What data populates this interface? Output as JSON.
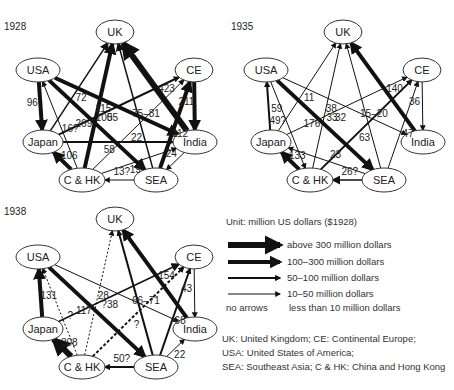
{
  "panels": [
    {
      "year": "1928",
      "ox": 0,
      "oy": 0
    },
    {
      "year": "1935",
      "ox": 228,
      "oy": 0
    },
    {
      "year": "1938",
      "ox": 0,
      "oy": 200
    }
  ],
  "nodes": [
    "UK",
    "CE",
    "USA",
    "Japan",
    "India",
    "C & HK",
    "SEA"
  ],
  "legend": {
    "unit": "Unit: million US dollars ($1928)",
    "items": [
      {
        "label": "above 300 million dollars",
        "width": 6
      },
      {
        "label": "100–300 million dollars",
        "width": 4
      },
      {
        "label": "50–100 million dollars",
        "width": 2
      },
      {
        "label": "10–50 million dollars",
        "width": 1
      }
    ],
    "no_arrows_key": "no arrows",
    "no_arrows_label": "less than 10 million dollars"
  },
  "abbrev": [
    "UK: United Kingdom; CE: Continental Europe;",
    "USA: United States of America;",
    "SEA: Southeast Asia; C & HK: China and Hong Kong"
  ],
  "chart_data": [
    {
      "year": "1928",
      "flows": [
        {
          "from": "USA",
          "to": "Japan",
          "value": "96",
          "w": 4
        },
        {
          "from": "Japan",
          "to": "UK",
          "value": "72",
          "w": 1.5
        },
        {
          "from": "C & HK",
          "to": "UK",
          "value": "100",
          "w": 4
        },
        {
          "from": "SEA",
          "to": "UK",
          "value": "75–81",
          "w": 1.5
        },
        {
          "from": "India",
          "to": "UK",
          "value": "423",
          "w": 6
        },
        {
          "from": "CE",
          "to": "India",
          "value": "211",
          "w": 4
        },
        {
          "from": "USA",
          "to": "India",
          "value": "115",
          "w": 4
        },
        {
          "from": "C & HK",
          "to": "USA",
          "value": "16?",
          "w": 1
        },
        {
          "from": "Japan",
          "to": "CE",
          "value": "55",
          "w": 2
        },
        {
          "from": "USA",
          "to": "SEA",
          "value": "269",
          "w": 4
        },
        {
          "from": "C & HK",
          "to": "CE",
          "value": "22",
          "w": 1
        },
        {
          "from": "SEA",
          "to": "CE",
          "value": "112",
          "w": 4
        },
        {
          "from": "Japan",
          "to": "India",
          "value": "58",
          "w": 2
        },
        {
          "from": "C & HK",
          "to": "Japan",
          "value": "106",
          "w": 4
        },
        {
          "from": "C & HK",
          "to": "India",
          "value": "19",
          "w": 1
        },
        {
          "from": "SEA",
          "to": "C & HK",
          "value": "13?",
          "w": 1
        },
        {
          "from": "India",
          "to": "SEA",
          "value": "24",
          "w": 1
        }
      ]
    },
    {
      "year": "1935",
      "flows": [
        {
          "from": "Japan",
          "to": "USA",
          "value": "59",
          "w": 2
        },
        {
          "from": "Japan",
          "to": "UK",
          "value": "11",
          "w": 1
        },
        {
          "from": "C & HK",
          "to": "UK",
          "value": "33",
          "w": 1
        },
        {
          "from": "SEA",
          "to": "UK",
          "value": "15–20",
          "w": 1
        },
        {
          "from": "India",
          "to": "UK",
          "value": "140",
          "w": 4
        },
        {
          "from": "CE",
          "to": "India",
          "value": "36",
          "w": 1
        },
        {
          "from": "USA",
          "to": "India",
          "value": "38",
          "w": 1
        },
        {
          "from": "USA",
          "to": "C & HK",
          "value": "49?",
          "w": 1
        },
        {
          "from": "Japan",
          "to": "CE",
          "value": "32",
          "w": 1
        },
        {
          "from": "USA",
          "to": "SEA",
          "value": "176",
          "w": 4
        },
        {
          "from": "C & HK",
          "to": "CE",
          "value": "63",
          "w": 2
        },
        {
          "from": "SEA",
          "to": "CE",
          "value": "47",
          "w": 1
        },
        {
          "from": "SEA",
          "to": "Japan",
          "value": "23",
          "w": 1
        },
        {
          "from": "C & HK",
          "to": "Japan",
          "value": "133",
          "w": 4
        },
        {
          "from": "SEA",
          "to": "C & HK",
          "value": "26?",
          "w": 1.5
        }
      ]
    },
    {
      "year": "1938",
      "flows": [
        {
          "from": "Japan",
          "to": "USA",
          "value": "131",
          "w": 4
        },
        {
          "from": "C & HK",
          "to": "UK",
          "value": "?",
          "w": 1,
          "dashed": true
        },
        {
          "from": "SEA",
          "to": "UK",
          "value": "66–71",
          "w": 2
        },
        {
          "from": "India",
          "to": "UK",
          "value": "154",
          "w": 4
        },
        {
          "from": "CE",
          "to": "India",
          "value": "43",
          "w": 1
        },
        {
          "from": "USA",
          "to": "India",
          "value": "28",
          "w": 1
        },
        {
          "from": "C & HK",
          "to": "USA",
          "value": "?",
          "w": 1,
          "dashed": true
        },
        {
          "from": "Japan",
          "to": "CE",
          "value": "38",
          "w": 1.5
        },
        {
          "from": "USA",
          "to": "SEA",
          "value": "117",
          "w": 4
        },
        {
          "from": "C & HK",
          "to": "CE",
          "value": "?",
          "w": 2,
          "dashed": true
        },
        {
          "from": "SEA",
          "to": "CE",
          "value": "68",
          "w": 2
        },
        {
          "from": "SEA",
          "to": "India",
          "value": "22",
          "w": 1
        },
        {
          "from": "C & HK",
          "to": "Japan",
          "value": "308",
          "w": 6
        },
        {
          "from": "SEA",
          "to": "C & HK",
          "value": "50?",
          "w": 2
        }
      ]
    }
  ]
}
